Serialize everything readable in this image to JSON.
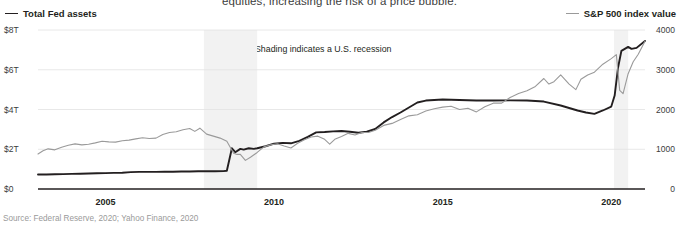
{
  "annotations": {
    "cutoff_body_text": "equities, increasing the risk of a price bubble.",
    "recession_note": "Shading indicates a U.S. recession",
    "recession_marker_icon": "triangle-left-icon",
    "source": "Source: Federal Reserve, 2020; Yahoo Finance, 2020"
  },
  "legend": {
    "left": {
      "label": "Total Fed assets",
      "color": "#231f20",
      "icon": "line-swatch-icon"
    },
    "right": {
      "label": "S&P 500 index value",
      "color": "#9a9a9a",
      "icon": "line-swatch-icon"
    }
  },
  "chart_data": {
    "type": "line",
    "title": "",
    "subtitle": "",
    "xlabel": "",
    "ylabel": "Total Fed assets",
    "y2label": "S&P 500 index value",
    "grid": true,
    "legend_position": "top",
    "xlim": [
      2003.0,
      2021.0
    ],
    "xticks": [
      2005,
      2010,
      2015,
      2020
    ],
    "xticklabels": [
      "2005",
      "2010",
      "2015",
      "2020"
    ],
    "ylim": [
      0,
      8
    ],
    "yticks": [
      0,
      2,
      4,
      6,
      8
    ],
    "yticklabels": [
      "$0",
      "$2T",
      "$4T",
      "$6T",
      "$8T"
    ],
    "y2lim": [
      0,
      4000
    ],
    "y2ticks": [
      0,
      1000,
      2000,
      3000,
      4000
    ],
    "y2ticklabels": [
      "0",
      "1000",
      "2000",
      "3000",
      "4000"
    ],
    "shaded_regions": [
      {
        "label": "U.S. recession",
        "x0": 2007.92,
        "x1": 2009.5,
        "color": "#f2f2f2"
      },
      {
        "label": "U.S. recession",
        "x0": 2020.08,
        "x1": 2020.5,
        "color": "#f2f2f2"
      }
    ],
    "series": [
      {
        "name": "Total Fed assets",
        "axis": "left",
        "color": "#231f20",
        "unit": "$T",
        "x": [
          2003.0,
          2003.25,
          2003.5,
          2003.75,
          2004.0,
          2004.25,
          2004.5,
          2004.75,
          2005.0,
          2005.25,
          2005.5,
          2005.75,
          2006.0,
          2006.25,
          2006.5,
          2006.75,
          2007.0,
          2007.25,
          2007.5,
          2007.75,
          2008.0,
          2008.25,
          2008.5,
          2008.6,
          2008.75,
          2008.85,
          2009.0,
          2009.1,
          2009.25,
          2009.4,
          2009.5,
          2009.75,
          2010.0,
          2010.25,
          2010.5,
          2010.75,
          2011.0,
          2011.25,
          2011.5,
          2011.75,
          2012.0,
          2012.25,
          2012.5,
          2012.75,
          2013.0,
          2013.25,
          2013.5,
          2013.75,
          2014.0,
          2014.25,
          2014.5,
          2014.75,
          2015.0,
          2015.5,
          2016.0,
          2016.5,
          2017.0,
          2017.5,
          2018.0,
          2018.5,
          2019.0,
          2019.25,
          2019.5,
          2019.75,
          2020.0,
          2020.1,
          2020.2,
          2020.3,
          2020.4,
          2020.5,
          2020.6,
          2020.75,
          2021.0
        ],
        "y": [
          0.73,
          0.73,
          0.74,
          0.75,
          0.76,
          0.77,
          0.78,
          0.79,
          0.8,
          0.81,
          0.82,
          0.85,
          0.86,
          0.86,
          0.86,
          0.87,
          0.87,
          0.88,
          0.88,
          0.89,
          0.89,
          0.89,
          0.9,
          0.92,
          2.05,
          1.85,
          2.02,
          1.98,
          2.05,
          2.02,
          2.05,
          2.15,
          2.28,
          2.32,
          2.3,
          2.42,
          2.62,
          2.85,
          2.87,
          2.9,
          2.92,
          2.88,
          2.83,
          2.88,
          3.02,
          3.35,
          3.62,
          3.85,
          4.1,
          4.35,
          4.45,
          4.48,
          4.5,
          4.48,
          4.45,
          4.45,
          4.46,
          4.45,
          4.4,
          4.2,
          3.95,
          3.85,
          3.78,
          3.95,
          4.15,
          4.7,
          6.1,
          6.95,
          7.05,
          7.15,
          7.05,
          7.1,
          7.45
        ],
        "annotation": "Fed balance sheet expands sharply in 2008 and again in 2020"
      },
      {
        "name": "S&P 500 index value",
        "axis": "right",
        "color": "#9a9a9a",
        "unit": "index",
        "x": [
          2003.0,
          2003.15,
          2003.3,
          2003.5,
          2003.7,
          2003.9,
          2004.1,
          2004.3,
          2004.5,
          2004.7,
          2004.9,
          2005.1,
          2005.3,
          2005.5,
          2005.7,
          2005.9,
          2006.1,
          2006.3,
          2006.5,
          2006.7,
          2006.9,
          2007.1,
          2007.3,
          2007.5,
          2007.65,
          2007.8,
          2008.0,
          2008.2,
          2008.4,
          2008.6,
          2008.8,
          2008.9,
          2009.0,
          2009.15,
          2009.3,
          2009.5,
          2009.7,
          2009.9,
          2010.1,
          2010.3,
          2010.5,
          2010.7,
          2010.9,
          2011.1,
          2011.3,
          2011.5,
          2011.65,
          2011.8,
          2012.0,
          2012.2,
          2012.4,
          2012.6,
          2012.8,
          2013.0,
          2013.25,
          2013.5,
          2013.75,
          2014.0,
          2014.25,
          2014.5,
          2014.75,
          2015.0,
          2015.25,
          2015.5,
          2015.75,
          2016.0,
          2016.25,
          2016.5,
          2016.75,
          2017.0,
          2017.25,
          2017.5,
          2017.75,
          2018.0,
          2018.15,
          2018.3,
          2018.5,
          2018.75,
          2018.95,
          2019.1,
          2019.3,
          2019.5,
          2019.75,
          2020.0,
          2020.15,
          2020.25,
          2020.35,
          2020.5,
          2020.65,
          2020.8,
          2021.0
        ],
        "y": [
          880,
          960,
          1010,
          985,
          1050,
          1100,
          1135,
          1110,
          1125,
          1160,
          1200,
          1185,
          1180,
          1215,
          1230,
          1260,
          1290,
          1270,
          1280,
          1370,
          1420,
          1440,
          1490,
          1520,
          1450,
          1530,
          1380,
          1330,
          1280,
          1200,
          900,
          870,
          870,
          720,
          800,
          920,
          1060,
          1110,
          1140,
          1080,
          1030,
          1150,
          1240,
          1310,
          1330,
          1250,
          1130,
          1250,
          1320,
          1400,
          1360,
          1420,
          1420,
          1480,
          1600,
          1650,
          1750,
          1840,
          1870,
          1960,
          2020,
          2060,
          2080,
          2000,
          2030,
          1940,
          2070,
          2160,
          2160,
          2300,
          2400,
          2470,
          2580,
          2780,
          2640,
          2700,
          2870,
          2640,
          2500,
          2760,
          2870,
          2940,
          3140,
          3280,
          3380,
          2480,
          2400,
          2900,
          3200,
          3390,
          3720
        ],
        "annotation": "Equity index recovers and reaches new highs after the 2020 shock"
      }
    ]
  }
}
